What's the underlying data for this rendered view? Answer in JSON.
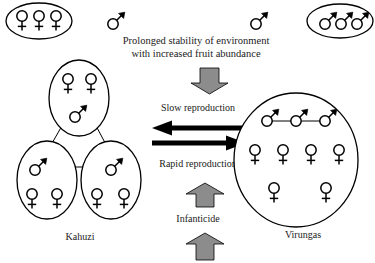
{
  "figure": {
    "heading_line1": "Prolonged stability of environment",
    "heading_line2": "with increased fruit abundance",
    "flow_slow": "Slow reproduction",
    "flow_rapid": "Rapid reproduction",
    "flow_infanticide": "Infanticide",
    "site_left": "Kahuzi",
    "site_right": "Virungas",
    "colors": {
      "outline": "#000000",
      "background": "#ffffff",
      "block_arrow_fill": "#8c8c8c",
      "flow_arrow_fill": "#000000",
      "text": "#1a1a1a"
    },
    "symbols": {
      "female": "female-symbol",
      "male": "male-symbol"
    },
    "groups": {
      "top_left_band": {
        "name": "all-female-band",
        "females": 3,
        "males": 0
      },
      "top_right_band": {
        "name": "all-male-band",
        "females": 0,
        "males": 3
      },
      "solitary_males": 2,
      "kahuzi_unit_top": {
        "females": 2,
        "males": 1
      },
      "kahuzi_unit_bottom_left": {
        "females": 2,
        "males": 1
      },
      "kahuzi_unit_bottom_right": {
        "females": 2,
        "males": 1
      },
      "virungas_group": {
        "males": 3,
        "females": 6
      }
    }
  }
}
